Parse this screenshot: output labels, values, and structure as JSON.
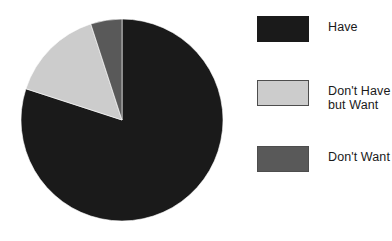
{
  "chart_data": {
    "type": "pie",
    "title": "",
    "categories": [
      "Have",
      "Don't Have but Want",
      "Don't Want"
    ],
    "values": [
      80,
      15,
      5
    ],
    "units": "percent",
    "colors": [
      "#1a1a1a",
      "#cccccc",
      "#595959"
    ],
    "start_angle_deg": 0,
    "direction": "clockwise",
    "legend_position": "right",
    "grid": false,
    "slices": [
      {
        "label": "Have",
        "value": 80,
        "color": "#1a1a1a",
        "start_deg": 0,
        "end_deg": 288
      },
      {
        "label": "Don't Have but Want",
        "value": 15,
        "color": "#cccccc",
        "start_deg": 288,
        "end_deg": 342
      },
      {
        "label": "Don't Want",
        "value": 5,
        "color": "#595959",
        "start_deg": 342,
        "end_deg": 360
      }
    ]
  },
  "legend": {
    "items": [
      {
        "label": "Have",
        "color": "#1a1a1a",
        "outlined": false
      },
      {
        "label": "Don't Have\nbut Want",
        "color": "#cccccc",
        "outlined": true
      },
      {
        "label": "Don't Want",
        "color": "#595959",
        "outlined": true
      }
    ]
  },
  "pie": {
    "center_x": 122,
    "center_y": 120,
    "radius": 101
  }
}
